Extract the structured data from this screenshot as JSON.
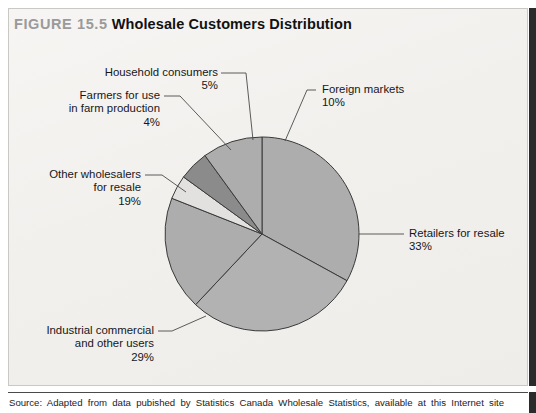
{
  "figure": {
    "number_label": "FIGURE 15.5",
    "title": "Wholesale Customers Distribution",
    "source_note": "Source: Adapted from data pubished by Statistics Canada Wholesale Statistics, available at this Internet site"
  },
  "colors": {
    "panel_background": "#f3f2f0",
    "panel_border": "#c9c8c5",
    "accent_bar": "#2b2b2b",
    "figure_number_text": "#9a9a9a",
    "title_text": "#111111",
    "label_text": "#16161a",
    "slice_outline": "#3a3a3a",
    "slice_medium": "#adadad",
    "slice_medium_alt": "#b2b2b2",
    "slice_dark": "#8b8b8b",
    "slice_light": "#e2e1df"
  },
  "chart_data": {
    "type": "pie",
    "title": "Wholesale Customers Distribution",
    "xlabel": "",
    "ylabel": "",
    "grid": false,
    "legend_position": "callout-labels",
    "units": "percent",
    "total": 100,
    "start_angle_deg": 0,
    "direction": "clockwise",
    "center_px": {
      "x": 262,
      "y": 234
    },
    "radius_px": 97,
    "categories": [
      "Retailers for resale",
      "Industrial commercial and other users",
      "Other wholesalers for resale",
      "Farmers for use in farm production",
      "Household consumers",
      "Foreign markets"
    ],
    "values": [
      33,
      29,
      19,
      4,
      5,
      10
    ],
    "slices": [
      {
        "label": "Retailers for resale",
        "value": 33,
        "pct_text": "33%",
        "color": "#adadad",
        "start_deg": 0,
        "end_deg": 118.8
      },
      {
        "label": "Industrial commercial and other users",
        "value": 29,
        "pct_text": "29%",
        "color": "#b2b2b2",
        "start_deg": 118.8,
        "end_deg": 223.2
      },
      {
        "label": "Other wholesalers for resale",
        "value": 19,
        "pct_text": "19%",
        "color": "#adadad",
        "start_deg": 223.2,
        "end_deg": 291.6
      },
      {
        "label": "Farmers for use in farm production",
        "value": 4,
        "pct_text": "4%",
        "color": "#e2e1df",
        "start_deg": 291.6,
        "end_deg": 306.0
      },
      {
        "label": "Household consumers",
        "value": 5,
        "pct_text": "5%",
        "color": "#8b8b8b",
        "start_deg": 306.0,
        "end_deg": 324.0
      },
      {
        "label": "Foreign markets",
        "value": 10,
        "pct_text": "10%",
        "color": "#adadad",
        "start_deg": 324.0,
        "end_deg": 360.0
      }
    ]
  },
  "callouts": {
    "household": {
      "line1": "Household consumers",
      "pct": "5%"
    },
    "farmers": {
      "line1": "Farmers for use",
      "line2": "in farm production",
      "pct": "4%"
    },
    "foreign": {
      "line1": "Foreign markets",
      "pct": "10%"
    },
    "retailers": {
      "line1": "Retailers for resale",
      "pct": "33%"
    },
    "wholesalers": {
      "line1": "Other wholesalers",
      "line2": "for resale",
      "pct": "19%"
    },
    "industrial": {
      "line1": "Industrial commercial",
      "line2": "and other users",
      "pct": "29%"
    }
  }
}
